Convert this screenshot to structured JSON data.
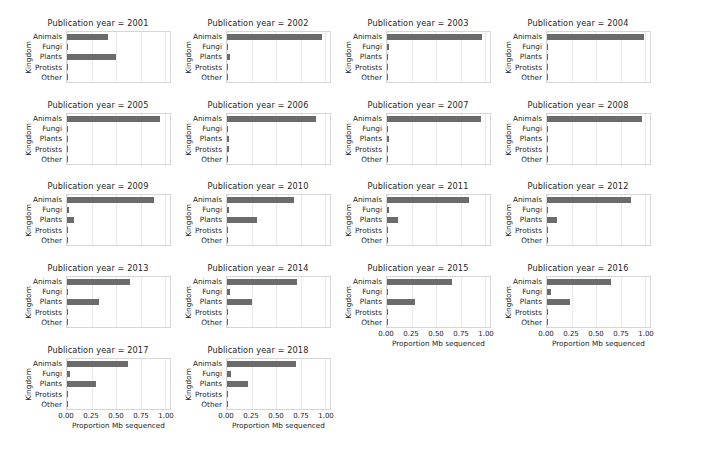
{
  "figure": {
    "kind": "seaborn-facetgrid-barplot",
    "bar_color": "#6b6b6b",
    "background": "#ffffff",
    "gridline_color": "#eaeaea",
    "spine_color": "#d6d6d6"
  },
  "axes": {
    "ylabel": "Kingdom",
    "xlabel": "Proportion Mb sequenced",
    "categories": [
      "Animals",
      "Fungi",
      "Plants",
      "Protists",
      "Other"
    ],
    "xticks": [
      "0.00",
      "0.25",
      "0.50",
      "0.75",
      "1.00"
    ],
    "xtick_values": [
      0,
      0.25,
      0.5,
      0.75,
      1.0
    ],
    "xlim": [
      0,
      1.05
    ]
  },
  "chart_data": {
    "type": "bar",
    "orientation": "horizontal",
    "title": "",
    "xlabel": "Proportion Mb sequenced",
    "ylabel": "Kingdom",
    "facet_variable": "Publication year",
    "facet_title_template": "Publication year = {year}",
    "categories": [
      "Animals",
      "Fungi",
      "Plants",
      "Protists",
      "Other"
    ],
    "xlim": [
      0,
      1.05
    ],
    "ylim_categories": 5,
    "grid": "vertical-only",
    "legend": "none",
    "ncols": 5,
    "panels": [
      {
        "year": "2001",
        "title": "Publication year = 2001",
        "values": [
          0.42,
          0.005,
          0.5,
          0.0,
          0.0
        ]
      },
      {
        "year": "2002",
        "title": "Publication year = 2002",
        "values": [
          0.97,
          0.0,
          0.03,
          0.0,
          0.0
        ]
      },
      {
        "year": "2003",
        "title": "Publication year = 2003",
        "values": [
          0.97,
          0.025,
          0.0,
          0.0,
          0.0
        ]
      },
      {
        "year": "2004",
        "title": "Publication year = 2004",
        "values": [
          0.985,
          0.0,
          0.008,
          0.0,
          0.0
        ]
      },
      {
        "year": "2005",
        "title": "Publication year = 2005",
        "values": [
          0.945,
          0.005,
          0.005,
          0.006,
          0.0
        ]
      },
      {
        "year": "2006",
        "title": "Publication year = 2006",
        "values": [
          0.905,
          0.0,
          0.018,
          0.02,
          0.0
        ]
      },
      {
        "year": "2007",
        "title": "Publication year = 2007",
        "values": [
          0.955,
          0.007,
          0.017,
          0.006,
          0.0
        ]
      },
      {
        "year": "2008",
        "title": "Publication year = 2008",
        "values": [
          0.965,
          0.004,
          0.006,
          0.0,
          0.0
        ]
      },
      {
        "year": "2009",
        "title": "Publication year = 2009",
        "values": [
          0.885,
          0.018,
          0.07,
          0.004,
          0.0
        ]
      },
      {
        "year": "2010",
        "title": "Publication year = 2010",
        "values": [
          0.685,
          0.018,
          0.31,
          0.0,
          0.0
        ]
      },
      {
        "year": "2011",
        "title": "Publication year = 2011",
        "values": [
          0.84,
          0.017,
          0.11,
          0.012,
          0.0
        ]
      },
      {
        "year": "2012",
        "title": "Publication year = 2012",
        "values": [
          0.86,
          0.008,
          0.1,
          0.008,
          0.0
        ]
      },
      {
        "year": "2013",
        "title": "Publication year = 2013",
        "values": [
          0.64,
          0.015,
          0.33,
          0.014,
          0.0
        ]
      },
      {
        "year": "2014",
        "title": "Publication year = 2014",
        "values": [
          0.715,
          0.03,
          0.25,
          0.005,
          0.0
        ]
      },
      {
        "year": "2015",
        "title": "Publication year = 2015",
        "values": [
          0.66,
          0.015,
          0.285,
          0.006,
          0.0
        ]
      },
      {
        "year": "2016",
        "title": "Publication year = 2016",
        "values": [
          0.655,
          0.045,
          0.235,
          0.006,
          0.0
        ]
      },
      {
        "year": "2017",
        "title": "Publication year = 2017",
        "values": [
          0.625,
          0.03,
          0.3,
          0.006,
          0.0
        ]
      },
      {
        "year": "2018",
        "title": "Publication year = 2018",
        "values": [
          0.7,
          0.04,
          0.215,
          0.006,
          0.0
        ]
      }
    ],
    "rows": [
      {
        "index": 0,
        "panels": [
          0,
          1,
          2,
          3
        ],
        "show_xaxis": [
          false,
          false,
          false,
          false
        ]
      },
      {
        "index": 1,
        "panels": [
          4,
          5,
          6,
          7
        ],
        "show_xaxis": [
          false,
          false,
          false,
          false
        ]
      },
      {
        "index": 2,
        "panels": [
          8,
          9,
          10,
          11
        ],
        "show_xaxis": [
          false,
          false,
          false,
          false
        ]
      },
      {
        "index": 3,
        "panels": [
          12,
          13,
          14,
          15
        ],
        "show_xaxis": [
          false,
          false,
          true,
          true
        ]
      },
      {
        "index": 4,
        "panels": [
          16,
          17
        ],
        "show_xaxis": [
          true,
          true
        ]
      }
    ]
  }
}
